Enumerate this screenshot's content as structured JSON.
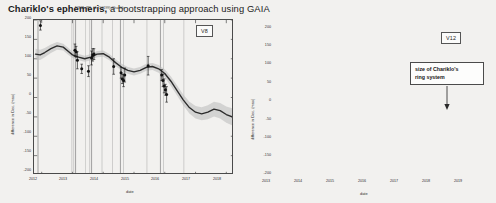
{
  "slide": {
    "right_title_lead": "Chariklo's ephemeris,",
    "right_title_rest": " a bootstrapping approach using GAIA",
    "background_color": "#f2f1ef"
  },
  "panels": [
    {
      "id": "left",
      "mini_title": "NIMA-JPL #1 (10199) Chariklo",
      "version_badge": "V8"
    },
    {
      "id": "right",
      "version_badge": "V12",
      "annotation": "size of Chariklo's\nring system"
    }
  ],
  "colors": {
    "curve": "#2b2b2b",
    "band": "#b9b9b9",
    "point": "#111111",
    "vline": "#9a9a9a",
    "axis": "#4a4a4a",
    "text": "#1b1b1b"
  },
  "chart_data": [
    {
      "type": "line",
      "panel": "left",
      "title": "NIMA-JPL #1 (10199) Chariklo",
      "subtitle": "V8",
      "xlabel": "date",
      "ylabel": "difference in Dec. (mas)",
      "xlim": [
        2011.75,
        2018.25
      ],
      "ylim": [
        -200,
        200
      ],
      "xticks": [
        2012,
        2013,
        2014,
        2015,
        2016,
        2017,
        2018
      ],
      "yticks": [
        200,
        150,
        100,
        50,
        0,
        -50,
        -100,
        -150,
        -200
      ],
      "grid": false,
      "series": [
        {
          "name": "ephemeris offset",
          "x": [
            2011.8,
            2011.95,
            2012.1,
            2012.3,
            2012.5,
            2012.7,
            2012.85,
            2013.0,
            2013.2,
            2013.4,
            2013.6,
            2013.8,
            2014.0,
            2014.2,
            2014.4,
            2014.6,
            2014.8,
            2015.0,
            2015.2,
            2015.4,
            2015.6,
            2015.8,
            2016.0,
            2016.2,
            2016.4,
            2016.6,
            2016.8,
            2017.0,
            2017.2,
            2017.4,
            2017.6,
            2017.8,
            2018.0,
            2018.2
          ],
          "y": [
            112,
            110,
            116,
            126,
            133,
            130,
            120,
            110,
            104,
            100,
            104,
            112,
            113,
            104,
            90,
            78,
            70,
            66,
            70,
            78,
            80,
            74,
            62,
            42,
            18,
            -6,
            -26,
            -38,
            -42,
            -38,
            -30,
            -34,
            -44,
            -50
          ]
        }
      ],
      "band": {
        "name": "1-sigma uncertainty",
        "upper_offset": [
          14,
          13,
          12,
          11,
          10,
          9,
          9,
          8,
          8,
          8,
          8,
          8,
          8,
          8,
          9,
          9,
          9,
          9,
          9,
          9,
          9,
          10,
          11,
          12,
          13,
          14,
          15,
          16,
          17,
          18,
          19,
          20,
          21,
          22
        ],
        "lower_offset": [
          14,
          13,
          12,
          11,
          10,
          9,
          9,
          8,
          8,
          8,
          8,
          8,
          8,
          8,
          9,
          9,
          9,
          9,
          9,
          9,
          9,
          10,
          11,
          12,
          13,
          14,
          15,
          16,
          17,
          18,
          19,
          20,
          21,
          22
        ]
      },
      "points": [
        {
          "x": 2011.96,
          "y": 186,
          "yerr": 12
        },
        {
          "x": 2013.08,
          "y": 122,
          "yerr": 16
        },
        {
          "x": 2013.12,
          "y": 118,
          "yerr": 14
        },
        {
          "x": 2013.16,
          "y": 96,
          "yerr": 22
        },
        {
          "x": 2013.3,
          "y": 74,
          "yerr": 12
        },
        {
          "x": 2013.52,
          "y": 68,
          "yerr": 14
        },
        {
          "x": 2013.62,
          "y": 102,
          "yerr": 18
        },
        {
          "x": 2013.66,
          "y": 110,
          "yerr": 16
        },
        {
          "x": 2013.7,
          "y": 112,
          "yerr": 14
        },
        {
          "x": 2014.34,
          "y": 80,
          "yerr": 20
        },
        {
          "x": 2014.58,
          "y": 64,
          "yerr": 14
        },
        {
          "x": 2014.62,
          "y": 48,
          "yerr": 12
        },
        {
          "x": 2014.66,
          "y": 44,
          "yerr": 16
        },
        {
          "x": 2014.7,
          "y": 58,
          "yerr": 18
        },
        {
          "x": 2015.46,
          "y": 82,
          "yerr": 24
        },
        {
          "x": 2015.9,
          "y": 58,
          "yerr": 14
        },
        {
          "x": 2015.94,
          "y": 44,
          "yerr": 16
        },
        {
          "x": 2015.98,
          "y": 30,
          "yerr": 18
        },
        {
          "x": 2016.02,
          "y": 20,
          "yerr": 14
        },
        {
          "x": 2016.06,
          "y": 8,
          "yerr": 20
        }
      ],
      "vlines": [
        2011.88,
        2012.98,
        2013.04,
        2013.1,
        2013.42,
        2013.56,
        2013.62,
        2013.96,
        2014.3,
        2014.56,
        2014.66,
        2015.42,
        2015.86,
        2015.96,
        2016.62
      ]
    },
    {
      "type": "line",
      "panel": "right",
      "subtitle": "V12",
      "xlabel": "date",
      "ylabel": "difference in Dec. (mas)",
      "xlim": [
        2012.75,
        2019.25
      ],
      "ylim": [
        -200,
        200
      ],
      "xticks": [
        2013,
        2014,
        2015,
        2016,
        2017,
        2018,
        2019
      ],
      "yticks": [
        200,
        150,
        100,
        50,
        0,
        -50,
        -100,
        -150,
        -200
      ],
      "grid": false,
      "series": [
        {
          "name": "ephemeris offset",
          "x": [
            2012.8,
            2013.0,
            2013.2,
            2013.4,
            2013.6,
            2013.8,
            2014.0,
            2014.2,
            2014.4,
            2014.6,
            2014.8,
            2015.0,
            2015.2,
            2015.4,
            2015.6,
            2015.8,
            2016.0,
            2016.2,
            2016.4,
            2016.6,
            2016.8,
            2017.0,
            2017.2,
            2017.4,
            2017.6,
            2017.8,
            2018.0,
            2018.2,
            2018.4,
            2018.6,
            2018.8,
            2019.0,
            2019.2
          ],
          "y": [
            108,
            110,
            118,
            126,
            128,
            120,
            108,
            98,
            92,
            88,
            84,
            80,
            84,
            92,
            96,
            88,
            70,
            46,
            22,
            0,
            -18,
            -32,
            -38,
            -34,
            -24,
            -22,
            -32,
            -52,
            -76,
            -100,
            -122,
            -140,
            -152
          ]
        }
      ],
      "band": {
        "name": "1-sigma uncertainty",
        "upper_offset": [
          7,
          6,
          5,
          4,
          4,
          4,
          4,
          4,
          4,
          4,
          4,
          4,
          4,
          4,
          4,
          4,
          4,
          4,
          4,
          4,
          5,
          5,
          6,
          6,
          7,
          8,
          9,
          10,
          11,
          12,
          13,
          14,
          15
        ],
        "lower_offset": [
          7,
          6,
          5,
          4,
          4,
          4,
          4,
          4,
          4,
          4,
          4,
          4,
          4,
          4,
          4,
          4,
          4,
          4,
          4,
          4,
          5,
          5,
          6,
          6,
          7,
          8,
          9,
          10,
          11,
          12,
          13,
          14,
          15
        ]
      },
      "points": [
        {
          "x": 2013.48,
          "y": 128,
          "yerr": 14
        },
        {
          "x": 2013.52,
          "y": 124,
          "yerr": 10
        },
        {
          "x": 2014.28,
          "y": 112,
          "yerr": 18
        },
        {
          "x": 2014.34,
          "y": 100,
          "yerr": 14
        },
        {
          "x": 2014.38,
          "y": 92,
          "yerr": 16
        },
        {
          "x": 2014.42,
          "y": 84,
          "yerr": 20
        },
        {
          "x": 2014.46,
          "y": 74,
          "yerr": 14
        },
        {
          "x": 2014.5,
          "y": 62,
          "yerr": 12
        },
        {
          "x": 2015.88,
          "y": 104,
          "yerr": 16
        },
        {
          "x": 2016.04,
          "y": 82,
          "yerr": 14
        },
        {
          "x": 2016.08,
          "y": 74,
          "yerr": 12
        },
        {
          "x": 2016.12,
          "y": 66,
          "yerr": 18
        }
      ],
      "vlines": [
        2012.92,
        2013.04,
        2013.44,
        2013.5,
        2013.54,
        2014.24,
        2014.34,
        2014.4,
        2014.46,
        2015.0,
        2015.56,
        2015.84,
        2016.0,
        2016.08,
        2016.16,
        2016.96,
        2017.3
      ],
      "ellipse_annotation": {
        "label": "size of Chariklo's ring system",
        "center_x": 2017.55,
        "center_y": -28,
        "rx_years": 0.3,
        "ry_mas": 42
      }
    }
  ]
}
